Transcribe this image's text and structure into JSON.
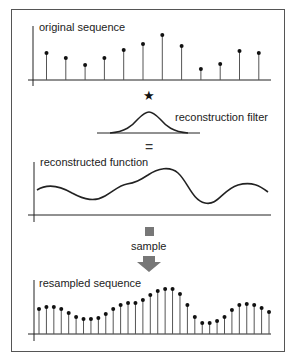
{
  "labels": {
    "original": "original sequence",
    "filter": "reconstruction filter",
    "reconstructed": "reconstructed function",
    "sample": "sample",
    "resampled": "resampled sequence",
    "convolve_symbol": "★",
    "equals_symbol": "="
  },
  "colors": {
    "stroke": "#222222",
    "frame": "#555555",
    "sample_marker": "#777777"
  },
  "chart_data": [
    {
      "type": "stem",
      "title": "original sequence",
      "x": [
        1,
        2,
        3,
        4,
        5,
        6,
        7,
        8,
        9,
        10,
        11,
        12
      ],
      "values": [
        27,
        22,
        15,
        22,
        30,
        36,
        45,
        34,
        11,
        16,
        29,
        27
      ],
      "grid": false
    },
    {
      "type": "line",
      "title": "reconstruction filter",
      "shape": "gaussian"
    },
    {
      "type": "line",
      "title": "reconstructed function",
      "shape": "smooth curve"
    },
    {
      "type": "stem",
      "title": "resampled sequence",
      "x": [
        1,
        2,
        3,
        4,
        5,
        6,
        7,
        8,
        9,
        10,
        11,
        12,
        13,
        14,
        15,
        16,
        17,
        18,
        19,
        20,
        21,
        22,
        23,
        24,
        25,
        26,
        27,
        28,
        29,
        30,
        31,
        32
      ],
      "values": [
        25,
        27,
        27,
        25,
        21,
        17,
        15,
        15,
        16,
        20,
        25,
        29,
        31,
        31,
        34,
        39,
        43,
        45,
        45,
        40,
        29,
        17,
        11,
        11,
        13,
        17,
        24,
        29,
        30,
        29,
        26,
        22
      ],
      "grid": false
    }
  ]
}
